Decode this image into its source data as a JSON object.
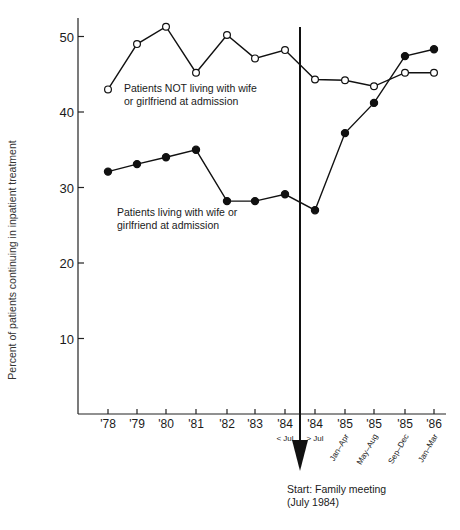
{
  "chart_data": {
    "type": "line",
    "title": "",
    "xlabel": "",
    "ylabel": "Percent of patients continuing in inpatient treatment",
    "ylim": [
      0,
      52
    ],
    "yticks": [
      10,
      20,
      30,
      40,
      50
    ],
    "grid": false,
    "categories": [
      "'78",
      "'79",
      "'80",
      "'81",
      "'82",
      "'83",
      "'84",
      "'84",
      "'85",
      "'85",
      "'85",
      "'86"
    ],
    "category_sublabels": [
      "",
      "",
      "",
      "",
      "",
      "",
      "< Jul",
      "> Jul",
      "Jan–Apr",
      "May–Aug",
      "Sep–Dec",
      "Jan–Mar"
    ],
    "series": [
      {
        "name": "Patients NOT living with wife or girlfriend at admission",
        "marker": "open-circle",
        "values": [
          43.0,
          49.0,
          51.3,
          45.2,
          50.2,
          47.1,
          48.2,
          44.3,
          44.2,
          43.4,
          45.2,
          45.2
        ]
      },
      {
        "name": "Patients living with wife or girlfriend at admission",
        "marker": "filled-circle",
        "values": [
          32.1,
          33.1,
          34.0,
          35.0,
          28.2,
          28.2,
          29.1,
          27.0,
          37.2,
          41.2,
          47.4,
          48.3
        ]
      }
    ],
    "annotations": [
      {
        "text_lines": [
          "Patients NOT living with wife",
          "or girlfriend at admission"
        ],
        "series": 0
      },
      {
        "text_lines": [
          "Patients living with wife or",
          "girlfriend at admission"
        ],
        "series": 1
      },
      {
        "text_lines": [
          "Start: Family meeting",
          "(July 1984)"
        ],
        "type": "vertical-arrow",
        "position": "between '84 < Jul and '84 > Jul"
      }
    ],
    "legend_position": "inline labels"
  }
}
